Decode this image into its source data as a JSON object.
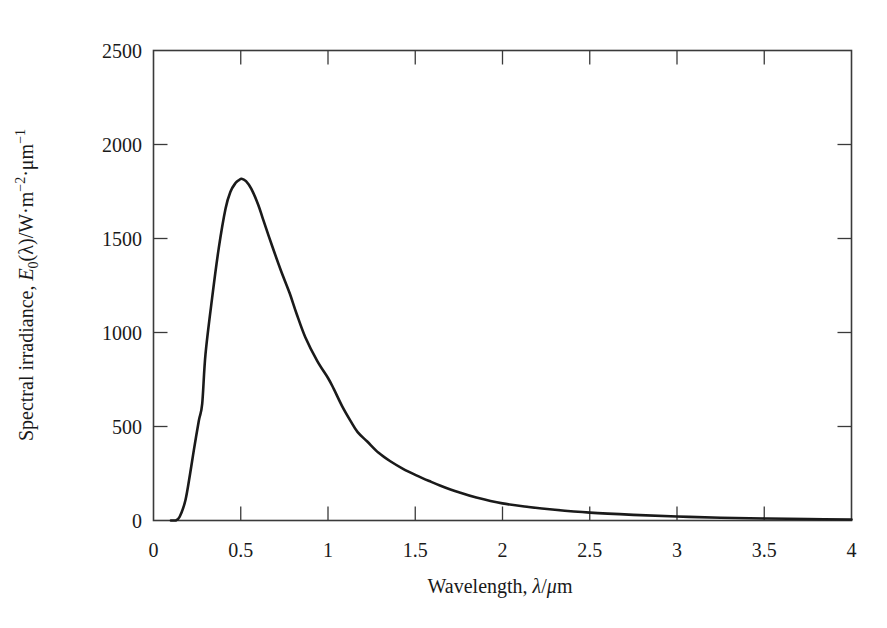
{
  "chart_data": {
    "type": "line",
    "title": "",
    "xlabel": "Wavelength, λ/μm",
    "ylabel": "Spectral irradiance, E₀(λ)/W·m⁻²·μm⁻¹",
    "ylabel_parts": {
      "prefix": "Spectral irradiance, ",
      "symbol": "E",
      "subscript": "0",
      "arg": "(λ)/W·m",
      "exp1": "−2",
      "mid": "·μm",
      "exp2": "−1"
    },
    "xlim": [
      0,
      4
    ],
    "ylim": [
      0,
      2500
    ],
    "xticks": [
      0,
      0.5,
      1,
      1.5,
      2,
      2.5,
      3,
      3.5,
      4
    ],
    "xtick_labels": [
      "0",
      "0.5",
      "1",
      "1.5",
      "2",
      "2.5",
      "3",
      "3.5",
      "4"
    ],
    "yticks": [
      0,
      500,
      1000,
      1500,
      2000,
      2500
    ],
    "ytick_labels": [
      "0",
      "500",
      "1000",
      "1500",
      "2000",
      "2500"
    ],
    "grid": false,
    "legend": null,
    "series": [
      {
        "name": "Spectral irradiance",
        "color": "#1a1a1a",
        "x": [
          0.1,
          0.126,
          0.15,
          0.183,
          0.21,
          0.231,
          0.26,
          0.279,
          0.298,
          0.336,
          0.374,
          0.413,
          0.441,
          0.47,
          0.489,
          0.505,
          0.53,
          0.56,
          0.6,
          0.63,
          0.68,
          0.73,
          0.78,
          0.82,
          0.87,
          0.938,
          1.0,
          1.033,
          1.08,
          1.129,
          1.17,
          1.225,
          1.29,
          1.357,
          1.43,
          1.5,
          1.58,
          1.645,
          1.75,
          1.85,
          2.0,
          2.15,
          2.3,
          2.5,
          2.75,
          3.0,
          3.25,
          3.5,
          3.75,
          4.0
        ],
        "y": [
          0,
          0,
          20,
          108,
          250,
          373,
          532,
          620,
          885,
          1184,
          1449,
          1660,
          1749,
          1795,
          1810,
          1818,
          1805,
          1765,
          1680,
          1596,
          1460,
          1330,
          1210,
          1100,
          975,
          849,
          758,
          700,
          610,
          530,
          470,
          420,
          360,
          315,
          275,
          243,
          210,
          185,
          150,
          122,
          91,
          72,
          57,
          42,
          30,
          21,
          15,
          11,
          8,
          5
        ]
      }
    ],
    "annotations": []
  }
}
